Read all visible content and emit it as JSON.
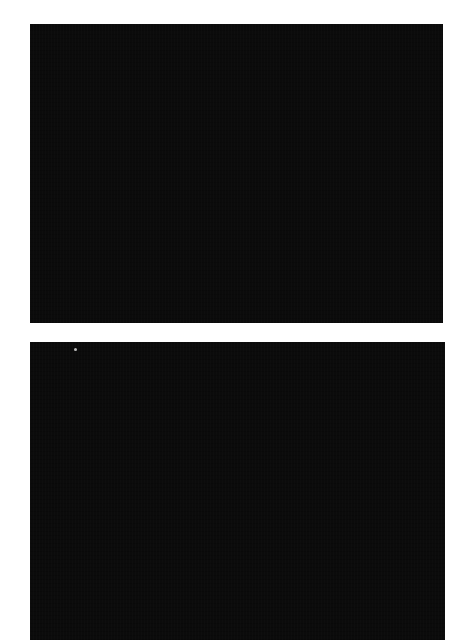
{
  "page": {
    "background": "#ffffff"
  },
  "panels": [
    {
      "id": "top",
      "color": "#0b0b0b"
    },
    {
      "id": "bottom",
      "color": "#0b0b0b"
    }
  ]
}
